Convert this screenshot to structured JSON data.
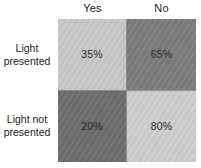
{
  "figure": {
    "background_color": "#ffffff",
    "border_color": "#8d8d8d",
    "text_color": "#222222"
  },
  "columns": [
    {
      "label": "Yes"
    },
    {
      "label": "No"
    }
  ],
  "rows": [
    {
      "line1": "Light",
      "line2": "presented"
    },
    {
      "line1": "Light not",
      "line2": "presented"
    }
  ],
  "cells": [
    {
      "value": "35%",
      "fill": "#c9c9c9",
      "row": "Light presented",
      "column": "Yes"
    },
    {
      "value": "65%",
      "fill": "#7d7d7d",
      "row": "Light presented",
      "column": "No"
    },
    {
      "value": "20%",
      "fill": "#6e6e6e",
      "row": "Light not presented",
      "column": "Yes"
    },
    {
      "value": "80%",
      "fill": "#cfcfcf",
      "row": "Light not presented",
      "column": "No"
    }
  ],
  "chart_data": {
    "type": "heatmap",
    "title": "",
    "xlabel": "",
    "ylabel": "",
    "categories": [
      "Yes",
      "No"
    ],
    "row_categories": [
      "Light presented",
      "Light not presented"
    ],
    "values": [
      [
        35,
        65
      ],
      [
        20,
        80
      ]
    ],
    "value_labels": [
      [
        "35%",
        "65%"
      ],
      [
        "20%",
        "80%"
      ]
    ],
    "cell_colors": [
      [
        "#c9c9c9",
        "#7d7d7d"
      ],
      [
        "#6e6e6e",
        "#cfcfcf"
      ]
    ],
    "unit": "%",
    "grid": true,
    "legend": "none"
  }
}
